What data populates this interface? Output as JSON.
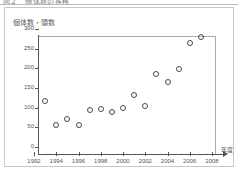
{
  "header": {
    "clipped_text": "図２　個体数の推移"
  },
  "figure": {
    "y_axis_label": "個体数・頭数",
    "x_axis_title": "年度"
  },
  "chart_data": {
    "type": "scatter",
    "title": "",
    "xlabel": "年度",
    "ylabel": "個体数・頭数",
    "xlim": [
      1992,
      2008
    ],
    "ylim": [
      0,
      300
    ],
    "xticks": [
      1992,
      1994,
      1996,
      1998,
      2000,
      2002,
      2004,
      2006,
      2008
    ],
    "yticks": [
      0,
      50,
      100,
      150,
      200,
      250,
      300
    ],
    "xticklabels": [
      "1992",
      "1994",
      "1996",
      "1998",
      "2000",
      "2002",
      "2004",
      "2006",
      "2008"
    ],
    "yticklabels": [
      "0",
      "50",
      "100",
      "150",
      "200",
      "250",
      "300"
    ],
    "grid": false,
    "legend": null,
    "marker": "open-circle",
    "marker_color": "#4a4a4a",
    "series": [
      {
        "name": "個体数",
        "points": [
          {
            "x": 1993,
            "y": 118
          },
          {
            "x": 1994,
            "y": 55
          },
          {
            "x": 1995,
            "y": 72
          },
          {
            "x": 1996,
            "y": 57
          },
          {
            "x": 1997,
            "y": 95
          },
          {
            "x": 1998,
            "y": 97
          },
          {
            "x": 1999,
            "y": 88
          },
          {
            "x": 2000,
            "y": 100
          },
          {
            "x": 2001,
            "y": 133
          },
          {
            "x": 2002,
            "y": 105
          },
          {
            "x": 2003,
            "y": 185
          },
          {
            "x": 2004,
            "y": 165
          },
          {
            "x": 2005,
            "y": 198
          },
          {
            "x": 2006,
            "y": 265
          },
          {
            "x": 2007,
            "y": 280
          }
        ]
      }
    ]
  }
}
